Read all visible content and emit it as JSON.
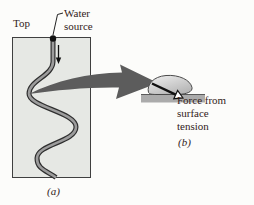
{
  "figure": {
    "labels": {
      "top": "Top",
      "water_source_line1": "Water",
      "water_source_line2": "source",
      "panel_a": "(a)",
      "force_line1": "Force from",
      "force_line2": "surface",
      "force_line3": "tension",
      "panel_b": "(b)"
    },
    "colors": {
      "background": "#fcfcfa",
      "text": "#33221a",
      "container_fill": "#e6e8e4",
      "container_border": "#3f3f3f",
      "stream_outline": "#2f2f2f",
      "stream_fill": "#9c9c9c",
      "source_dot": "#111111",
      "flow_arrow": "#111111",
      "leader_line": "#222222",
      "zoom_arrow": "#5c5c5c",
      "surface_bar": "#ababab",
      "surface_bar_edge": "#5a5a5a",
      "droplet_light": "#f0f0f0",
      "droplet_dark": "#b5b5b5",
      "droplet_stroke": "#4a4a4a",
      "tension_arrow": "#111111",
      "tension_arrowhead_fill": "#ffffff"
    }
  }
}
